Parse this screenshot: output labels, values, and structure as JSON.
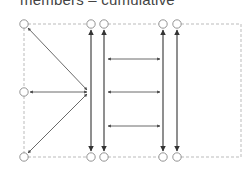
{
  "title": "members – cumulative",
  "colors": {
    "stroke": "#333333",
    "node": "#888888",
    "dashed": "#aaaaaa",
    "background": "#ffffff"
  },
  "diagram": {
    "frame": {
      "x1": 24,
      "y1": 24,
      "x2": 241,
      "y2": 157
    },
    "nodes": [
      {
        "id": "tl",
        "x": 24,
        "y": 24
      },
      {
        "id": "t1",
        "x": 91,
        "y": 24
      },
      {
        "id": "t2",
        "x": 104,
        "y": 24
      },
      {
        "id": "t3",
        "x": 163,
        "y": 24
      },
      {
        "id": "t4",
        "x": 177,
        "y": 24
      },
      {
        "id": "ml",
        "x": 24,
        "y": 92
      },
      {
        "id": "bl",
        "x": 24,
        "y": 157
      },
      {
        "id": "b1",
        "x": 91,
        "y": 157
      },
      {
        "id": "b2",
        "x": 104,
        "y": 157
      },
      {
        "id": "b3",
        "x": 163,
        "y": 157
      },
      {
        "id": "b4",
        "x": 177,
        "y": 157
      }
    ],
    "hub": {
      "x": 88,
      "y": 92
    },
    "vertical_double_arrows_x": [
      91,
      104,
      163,
      177
    ],
    "horizontal_double_arrows_y": [
      59,
      92,
      126
    ],
    "horizontal_span": {
      "x1": 107,
      "x2": 160
    }
  }
}
